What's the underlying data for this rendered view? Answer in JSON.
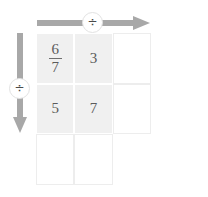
{
  "grid": {
    "rows": 3,
    "cols": 3,
    "cells": [
      {
        "id": "r1c1",
        "row": 1,
        "col": 1,
        "style": "shaded",
        "type": "fraction",
        "numerator": "6",
        "denominator": "7",
        "text": ""
      },
      {
        "id": "r1c2",
        "row": 1,
        "col": 2,
        "style": "shaded",
        "type": "number",
        "text": "3"
      },
      {
        "id": "r1c3",
        "row": 1,
        "col": 3,
        "style": "outlined",
        "type": "empty",
        "text": ""
      },
      {
        "id": "r2c1",
        "row": 2,
        "col": 1,
        "style": "shaded",
        "type": "number",
        "text": "5"
      },
      {
        "id": "r2c2",
        "row": 2,
        "col": 2,
        "style": "shaded",
        "type": "number",
        "text": "7"
      },
      {
        "id": "r2c3",
        "row": 2,
        "col": 3,
        "style": "outlined",
        "type": "empty",
        "text": ""
      },
      {
        "id": "r3c1",
        "row": 3,
        "col": 1,
        "style": "outlined",
        "type": "empty",
        "text": ""
      },
      {
        "id": "r3c2",
        "row": 3,
        "col": 2,
        "style": "outlined",
        "type": "empty",
        "text": ""
      },
      {
        "id": "r3c3",
        "row": 3,
        "col": 3,
        "style": "hidden",
        "type": "empty",
        "text": ""
      }
    ]
  },
  "operators": {
    "top": {
      "icon": "division-icon",
      "symbol": "÷",
      "direction": "right"
    },
    "left": {
      "icon": "division-icon",
      "symbol": "÷",
      "direction": "down"
    }
  },
  "colors": {
    "arrow": "#a8a8a8",
    "cell_fill": "#f0f0f0",
    "cell_border": "#ededed",
    "separator": "#ffffff",
    "text": "#5b5b5b",
    "badge_border": "#e2e2e2",
    "background": "#ffffff"
  }
}
